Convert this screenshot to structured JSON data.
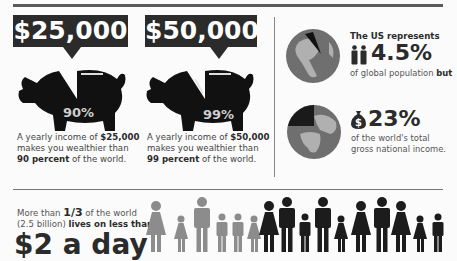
{
  "section_wealth": {
    "items": [
      {
        "income": "$25,000",
        "percent": "90%",
        "caption_pre": "A yearly income of ",
        "caption_income": "$25,000",
        "caption_mid": "makes you wealthier than",
        "caption_percent": "90 percent",
        "caption_post": " of the world."
      },
      {
        "income": "$50,000",
        "percent": "99%",
        "caption_pre": "A yearly income of ",
        "caption_income": "$50,000",
        "caption_mid": "makes you wealthier than",
        "caption_percent": "99 percent",
        "caption_post": " of the world."
      }
    ]
  },
  "section_us": {
    "population": {
      "label": "The US represents",
      "value": "4.5%",
      "icon": "people-icon",
      "sub_pre": "of global population ",
      "sub_emph": "but"
    },
    "income": {
      "value": "23%",
      "icon": "money-bag-icon",
      "sub_line1": "of the world's total",
      "sub_line2": "gross national income."
    }
  },
  "section_poverty": {
    "line1_pre": "More than ",
    "fraction": "1/3",
    "line1_post": " of the world",
    "line2_pre": "(2.5 billion) ",
    "line2_emph": "lives on less than",
    "headline": "$2 a day",
    "people_gray": [
      "woman",
      "girl",
      "man",
      "boy",
      "boy",
      "girl"
    ],
    "people_black": [
      "woman",
      "man",
      "boy",
      "man",
      "girl",
      "woman",
      "man",
      "woman",
      "girl",
      "boy"
    ]
  },
  "colors": {
    "dark": "#2b2b2b",
    "gray_figure": "#8c8c8c",
    "globe_ocean": "#707070",
    "globe_land": "#b0b0b0",
    "background": "#fbfbfb"
  }
}
